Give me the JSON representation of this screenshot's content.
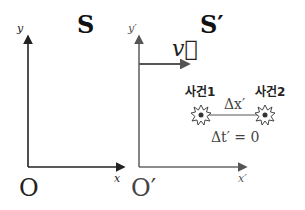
{
  "frames": [
    {
      "id": "S",
      "title": "S",
      "origin_label": "O",
      "x_axis_label": "x",
      "y_axis_label": "y",
      "axis_color": "#222222"
    },
    {
      "id": "S_prime",
      "title": "S′",
      "origin_label": "O′",
      "x_axis_label": "x′",
      "y_axis_label": "y′",
      "axis_color": "#666666"
    }
  ],
  "velocity": {
    "label": "v⃗",
    "arrow_color": "#555555"
  },
  "events": [
    {
      "label": "사건1"
    },
    {
      "label": "사건2"
    }
  ],
  "separation_label": "Δx′",
  "time_difference_label": "Δt′ = 0"
}
